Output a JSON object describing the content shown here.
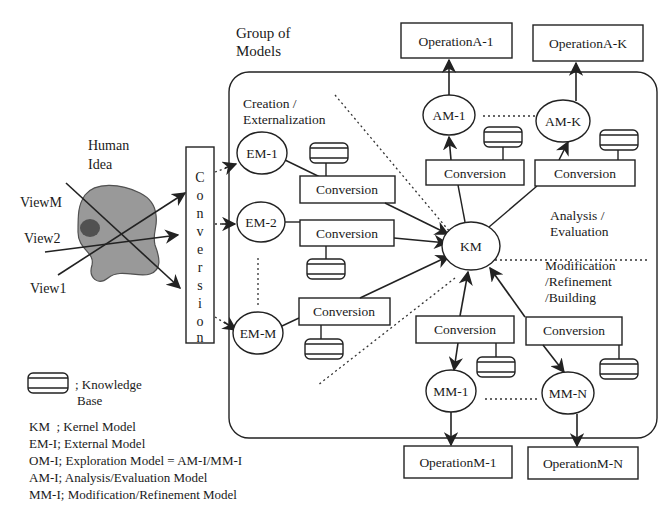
{
  "title": "Group of Models",
  "title_lines": [
    "Group of",
    "Models"
  ],
  "human_idea": {
    "label_lines": [
      "Human",
      "Idea"
    ],
    "views": [
      "ViewM",
      "View2",
      "View1"
    ]
  },
  "conversion_vertical": {
    "letters": [
      "C",
      "o",
      "n",
      "v",
      "e",
      "r",
      "s",
      "i",
      "o",
      "n"
    ]
  },
  "sections": {
    "creation": [
      "Creation /",
      "Externalization"
    ],
    "analysis": [
      "Analysis /",
      "Evaluation"
    ],
    "modification": [
      "Modification",
      "/Refinement",
      "/Building"
    ]
  },
  "external_models": [
    {
      "label": "EM-1",
      "conversion": "Conversion"
    },
    {
      "label": "EM-2",
      "conversion": "Conversion"
    },
    {
      "label": "EM-M",
      "conversion": "Conversion"
    }
  ],
  "kernel": {
    "label": "KM"
  },
  "analysis_models": [
    {
      "label": "AM-1",
      "conversion": "Conversion",
      "operation": "OperationA-1"
    },
    {
      "label": "AM-K",
      "conversion": "Conversion",
      "operation": "OperationA-K"
    }
  ],
  "modification_models": [
    {
      "label": "MM-1",
      "conversion": "Conversion",
      "operation": "OperationM-1"
    },
    {
      "label": "MM-N",
      "conversion": "Conversion",
      "operation": "OperationM-N"
    }
  ],
  "legend": {
    "knowledge_base_lines": [
      "; Knowledge",
      "Base"
    ],
    "entries": [
      "KM  ; Kernel Model",
      "EM-I; External Model",
      "OM-I; Exploration Model = AM-I/MM-I",
      "AM-I; Analysis/Evaluation Model",
      "MM-I; Modification/Refinement Model"
    ]
  }
}
